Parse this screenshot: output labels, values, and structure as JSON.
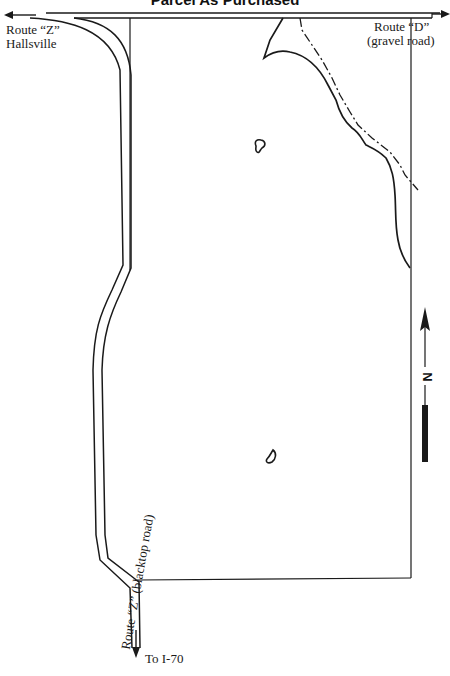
{
  "map": {
    "title": "Parcel As Purchased",
    "labels": {
      "route_z_top_line1": "Route “Z”",
      "route_z_top_line2": "Hallsville",
      "route_d_line1": "Route “D”",
      "route_d_line2": "(gravel road)",
      "route_z_side": "Route “Z” (blacktop road)",
      "to_i70": "To I-70",
      "north": "N"
    },
    "features": [
      {
        "type": "road",
        "name": "Route D (gravel road)",
        "direction": "east-west"
      },
      {
        "type": "road",
        "name": "Route Z (blacktop road)",
        "direction": "north-south",
        "to": "Hallsville / I-70"
      },
      {
        "type": "parcel-boundary",
        "name": "Parcel"
      },
      {
        "type": "creek",
        "name": "Creek"
      },
      {
        "type": "dash-dot-line",
        "name": "Creek boundary"
      },
      {
        "type": "pond",
        "name": "Pond (north)"
      },
      {
        "type": "pond",
        "name": "Pond (south)"
      },
      {
        "type": "north-arrow",
        "name": "North arrow"
      }
    ],
    "colors": {
      "ink": "#1a1a1a",
      "background": "#ffffff"
    }
  }
}
